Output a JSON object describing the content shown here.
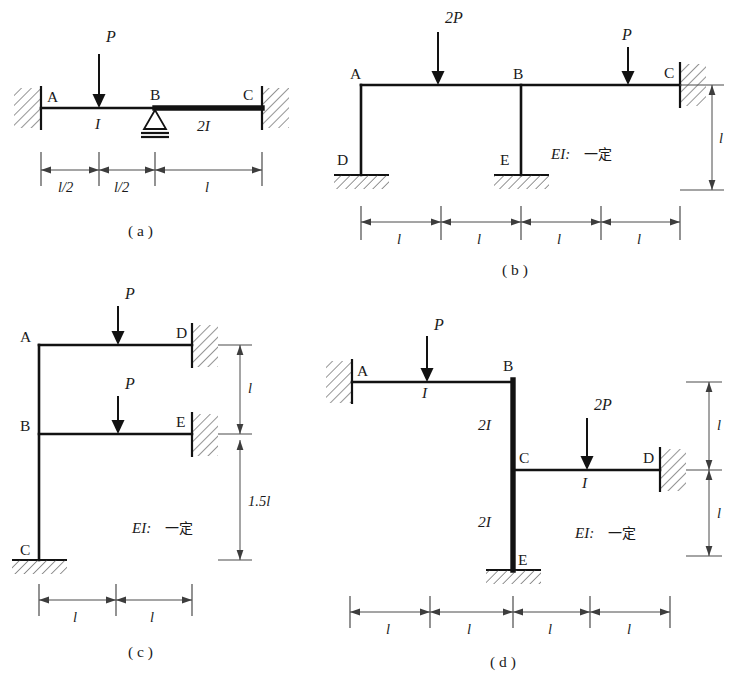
{
  "figure": {
    "background_color": "#ffffff",
    "line_color": "#121212",
    "dim_color": "#4a4a4a",
    "panels": [
      {
        "id": "a",
        "caption": "( a )",
        "type": "continuous-beam",
        "nodes": [
          "A",
          "B",
          "C"
        ],
        "supports": [
          {
            "at": "A",
            "kind": "fixed-wall-left"
          },
          {
            "at": "B",
            "kind": "pin-triangle"
          },
          {
            "at": "C",
            "kind": "fixed-wall-right"
          }
        ],
        "loads": [
          {
            "label": "P",
            "kind": "point-down",
            "at": "midspan-AB"
          }
        ],
        "stiffness_labels": [
          "I",
          "2I"
        ],
        "dimensions": [
          "l/2",
          "l/2",
          "l"
        ]
      },
      {
        "id": "b",
        "caption": "( b )",
        "type": "frame",
        "nodes": [
          "A",
          "B",
          "C",
          "D",
          "E"
        ],
        "supports": [
          {
            "at": "D",
            "kind": "fixed-ground"
          },
          {
            "at": "E",
            "kind": "fixed-ground"
          },
          {
            "at": "C",
            "kind": "fixed-wall-right"
          }
        ],
        "loads": [
          {
            "label": "2P",
            "kind": "point-down",
            "at": "span-AB"
          },
          {
            "label": "P",
            "kind": "point-down",
            "at": "span-BC"
          }
        ],
        "note": "EI:",
        "note_cn": "一定",
        "dimensions_h": [
          "l",
          "l",
          "l",
          "l"
        ],
        "dimensions_v": [
          "l"
        ]
      },
      {
        "id": "c",
        "caption": "( c )",
        "type": "frame",
        "nodes": [
          "A",
          "B",
          "C",
          "D",
          "E"
        ],
        "supports": [
          {
            "at": "C",
            "kind": "fixed-ground"
          },
          {
            "at": "D",
            "kind": "fixed-wall-right"
          },
          {
            "at": "E",
            "kind": "fixed-wall-right"
          }
        ],
        "loads": [
          {
            "label": "P",
            "kind": "point-down",
            "at": "span-AD"
          },
          {
            "label": "P",
            "kind": "point-down",
            "at": "span-BE"
          }
        ],
        "note": "EI:",
        "note_cn": "一定",
        "dimensions_h": [
          "l",
          "l"
        ],
        "dimensions_v": [
          "l",
          "1.5l"
        ]
      },
      {
        "id": "d",
        "caption": "( d )",
        "type": "frame",
        "nodes": [
          "A",
          "B",
          "C",
          "D",
          "E"
        ],
        "supports": [
          {
            "at": "A",
            "kind": "fixed-wall-left"
          },
          {
            "at": "D",
            "kind": "fixed-wall-right"
          },
          {
            "at": "E",
            "kind": "fixed-ground"
          }
        ],
        "loads": [
          {
            "label": "P",
            "kind": "point-down",
            "at": "span-AB"
          },
          {
            "label": "2P",
            "kind": "point-down",
            "at": "span-CD"
          }
        ],
        "stiffness_labels": [
          "I",
          "2I",
          "2I",
          "I"
        ],
        "note": "EI:",
        "note_cn": "一定",
        "dimensions_h": [
          "l",
          "l",
          "l",
          "l"
        ],
        "dimensions_v": [
          "l",
          "l"
        ]
      }
    ]
  },
  "panel_a": {
    "caption": "( a )",
    "node_A": "A",
    "node_B": "B",
    "node_C": "C",
    "load_P": "P",
    "stiff_I": "I",
    "stiff_2I": "2I",
    "dim_half_1": "l/2",
    "dim_half_2": "l/2",
    "dim_l": "l"
  },
  "panel_b": {
    "caption": "( b )",
    "node_A": "A",
    "node_B": "B",
    "node_C": "C",
    "node_D": "D",
    "node_E": "E",
    "load_2P": "2P",
    "load_P": "P",
    "note_ei": "EI:",
    "note_cn": "一定",
    "dim_l1": "l",
    "dim_l2": "l",
    "dim_l3": "l",
    "dim_l4": "l",
    "dim_v": "l"
  },
  "panel_c": {
    "caption": "( c )",
    "node_A": "A",
    "node_B": "B",
    "node_C": "C",
    "node_D": "D",
    "node_E": "E",
    "load_P1": "P",
    "load_P2": "P",
    "note_ei": "EI:",
    "note_cn": "一定",
    "dim_l1": "l",
    "dim_l2": "l",
    "dim_v1": "l",
    "dim_v2": "1.5l"
  },
  "panel_d": {
    "caption": "( d )",
    "node_A": "A",
    "node_B": "B",
    "node_C": "C",
    "node_D": "D",
    "node_E": "E",
    "load_P": "P",
    "load_2P": "2P",
    "stiff_I_top": "I",
    "stiff_2I_upper": "2I",
    "stiff_2I_lower": "2I",
    "stiff_I_right": "I",
    "note_ei": "EI:",
    "note_cn": "一定",
    "dim_l1": "l",
    "dim_l2": "l",
    "dim_l3": "l",
    "dim_l4": "l",
    "dim_v1": "l",
    "dim_v2": "l"
  }
}
